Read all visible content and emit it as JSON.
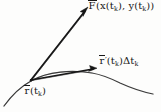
{
  "figure": {
    "kind": "hand-drawn-vector-diagram",
    "background_color": "#fdfdfc",
    "ink_color": "#181818",
    "width": 161,
    "height": 112
  },
  "labels": {
    "force_vector": {
      "name": "force-vector-label",
      "full_text": "F̄(x(tₖ), y(tₖ))",
      "symbol": "F",
      "overbar": true,
      "arg_open": "(x(",
      "arg_sub1": "k",
      "arg_mid": "), y(",
      "arg_sub2": "k",
      "arg_close": "))",
      "t1": "t",
      "t2": "t",
      "x": 88,
      "y": 1
    },
    "tangent_vector": {
      "name": "tangent-vector-label",
      "full_text": "r̄'(tₖ)Δtₖ",
      "symbol": "r",
      "overbar": true,
      "prime": "′",
      "paren_open": "(",
      "t": "t",
      "sub_k": "k",
      "paren_close": ")",
      "delta": "Δ",
      "delta_t": "t",
      "delta_sub_k": "k",
      "x": 99,
      "y": 56
    },
    "position_vector": {
      "name": "position-vector-label",
      "full_text": "r̄(tₖ)",
      "symbol": "r",
      "overbar": true,
      "paren_open": "(",
      "t": "t",
      "sub_k": "k",
      "paren_close": ")",
      "x": 24,
      "y": 86
    }
  },
  "geometry": {
    "origin_point": {
      "name": "vector-origin",
      "x": 31,
      "y": 80
    },
    "force_arrow": {
      "name": "force-arrow",
      "from": [
        31,
        80
      ],
      "to": [
        88,
        8
      ],
      "stroke_width": 1.7,
      "arrowhead": true
    },
    "tangent_arrow": {
      "name": "tangent-arrow",
      "from": [
        31,
        80
      ],
      "to": [
        97,
        68
      ],
      "stroke_width": 1.6,
      "arrowhead": true
    },
    "curve": {
      "name": "parametric-curve",
      "stroke_width": 1.2,
      "start": [
        4,
        106
      ],
      "control_1": [
        24,
        82
      ],
      "control_2": [
        70,
        72
      ],
      "peak": [
        104,
        80
      ],
      "end": [
        153,
        94
      ]
    }
  }
}
